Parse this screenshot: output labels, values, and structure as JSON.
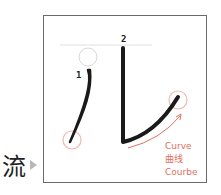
{
  "character": "流",
  "stroke_numbers": [
    "1",
    "2"
  ],
  "annotation": {
    "lines": [
      "Curve",
      "曲线",
      "Courbe"
    ],
    "color": "#e07060"
  },
  "glyph": "儿"
}
